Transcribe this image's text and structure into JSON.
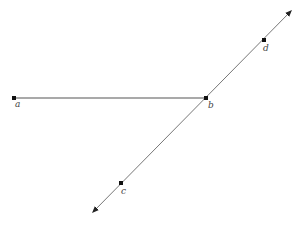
{
  "diagram": {
    "type": "geometry",
    "colors": {
      "segment": "#555555",
      "line": "#777777",
      "point": "#111111",
      "label": "#444444"
    },
    "points": [
      {
        "id": "a",
        "label": "a",
        "x": 14,
        "y": 98,
        "label_dx": 1,
        "label_dy": 9
      },
      {
        "id": "b",
        "label": "b",
        "x": 206,
        "y": 98,
        "label_dx": 2,
        "label_dy": 10
      },
      {
        "id": "d",
        "label": "d",
        "x": 264,
        "y": 40,
        "label_dx": -1,
        "label_dy": 11
      },
      {
        "id": "c",
        "label": "c",
        "x": 121,
        "y": 183,
        "label_dx": 0,
        "label_dy": 11
      }
    ],
    "segments": [
      {
        "id": "segment-ab",
        "from": "a",
        "to": "b"
      }
    ],
    "lines": [
      {
        "id": "line-cd",
        "through": [
          "c",
          "b",
          "d"
        ],
        "x1": 93,
        "y1": 212,
        "x2": 291,
        "y2": 11,
        "arrows": "both"
      }
    ]
  }
}
